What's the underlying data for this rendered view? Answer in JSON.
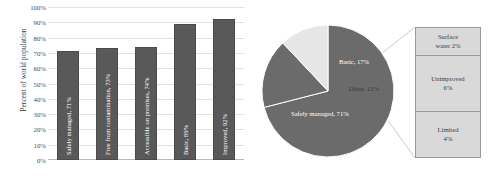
{
  "chart_data": [
    {
      "type": "bar",
      "title": "",
      "xlabel": "",
      "ylabel": "Percent of world population",
      "ylim": [
        0,
        100
      ],
      "grid": true,
      "categories": [
        "Safely managed",
        "Free from contamination",
        "Accessible on premises",
        "Basic",
        "Improved"
      ],
      "values": [
        71,
        73,
        74,
        89,
        92
      ],
      "bar_labels": [
        "Safely managed, 71%",
        "Free from contamination, 73%",
        "Accessible on premises, 74%",
        "Basic, 89%",
        "Improved, 92%"
      ],
      "ytick_labels": [
        "100%",
        "90%",
        "80%",
        "70%",
        "60%",
        "50%",
        "40%",
        "30%",
        "20%",
        "10%",
        "0%"
      ],
      "ytick_values": [
        100,
        90,
        80,
        70,
        60,
        50,
        40,
        30,
        20,
        10,
        0
      ],
      "bar_color": "#595959",
      "grid_color": "#e2e2e2"
    },
    {
      "type": "pie",
      "title": "",
      "labels": [
        "Safely managed",
        "Basic",
        "Other"
      ],
      "values": [
        71,
        17,
        12
      ],
      "slice_labels": [
        "Safely managed, 71%",
        "Basic, 17%",
        "Other, 12%"
      ],
      "colors": [
        "#6b6b6b",
        "#6b6b6b",
        "#e6e6e6"
      ],
      "legend_position": "none",
      "annotations": [
        "Other slice is expanded into the adjacent breakdown box"
      ]
    },
    {
      "type": "bar",
      "title": "Other breakdown",
      "orientation": "stacked-vertical",
      "categories": [
        "Surface water",
        "Unimproved",
        "Limited"
      ],
      "values": [
        2,
        6,
        4
      ],
      "segment_labels": [
        {
          "name": "Surface water",
          "pct": "2%"
        },
        {
          "name": "Unimproved",
          "pct": "6%"
        },
        {
          "name": "Limited",
          "pct": "4%"
        }
      ],
      "fill_color": "#d9d9d9",
      "border_color": "#9a9a9a"
    }
  ],
  "bar_chart": {
    "y_axis_title": "Percent of world population",
    "ticks": [
      "100%",
      "90%",
      "80%",
      "70%",
      "60%",
      "50%",
      "40%",
      "30%",
      "20%",
      "10%",
      "0%"
    ],
    "bars": [
      {
        "label": "Safely managed, 71%",
        "value": 71
      },
      {
        "label": "Free from contamination, 73%",
        "value": 73
      },
      {
        "label": "Accessible on premises, 74%",
        "value": 74
      },
      {
        "label": "Basic, 89%",
        "value": 89
      },
      {
        "label": "Improved, 92%",
        "value": 92
      }
    ]
  },
  "pie_chart": {
    "slices": [
      {
        "label": "Safely managed, 71%",
        "value": 71
      },
      {
        "label": "Basic, 17%",
        "value": 17
      },
      {
        "label": "Other, 12%",
        "value": 12
      }
    ]
  },
  "callout": {
    "segments": [
      {
        "name": "Surface",
        "name2": "water 2%"
      },
      {
        "name": "Unimproved",
        "name2": "6%"
      },
      {
        "name": "Limited",
        "name2": "4%"
      }
    ]
  }
}
